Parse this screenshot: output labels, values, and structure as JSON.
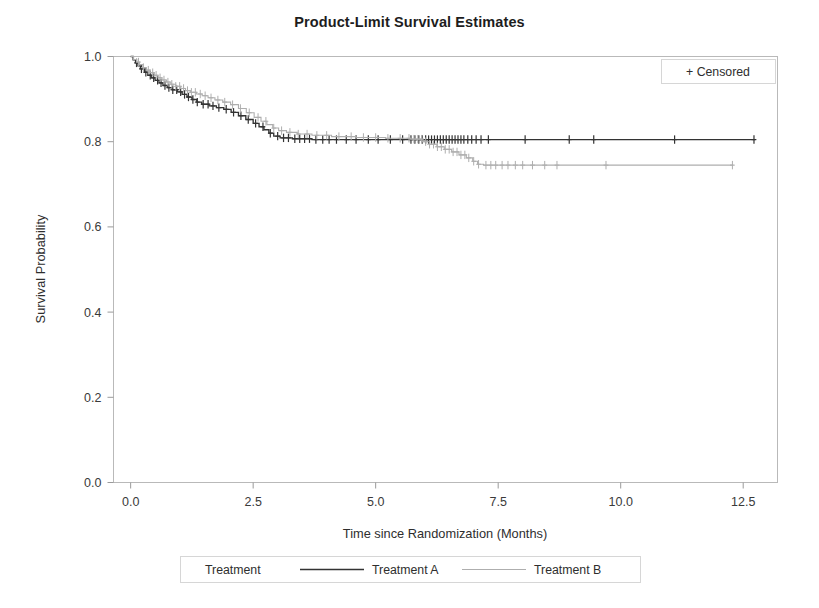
{
  "chart_data": {
    "type": "line",
    "title": "Product-Limit Survival Estimates",
    "xlabel": "Time since Randomization (Months)",
    "ylabel": "Survival Probability",
    "xlim": [
      -0.35,
      13.2
    ],
    "ylim": [
      0.0,
      1.0
    ],
    "xticks": [
      "0.0",
      "2.5",
      "5.0",
      "7.5",
      "10.0",
      "12.5"
    ],
    "xtick_values": [
      0.0,
      2.5,
      5.0,
      7.5,
      10.0,
      12.5
    ],
    "yticks": [
      "0.0",
      "0.2",
      "0.4",
      "0.6",
      "0.8",
      "1.0"
    ],
    "ytick_values": [
      0.0,
      0.2,
      0.4,
      0.6,
      0.8,
      1.0
    ],
    "grid": false,
    "legend_position": "bottom-center",
    "censored_annotation": "+ Censored",
    "censored_marker": "+",
    "legend_title": "Treatment",
    "series": [
      {
        "name": "Treatment A",
        "color": "#333333",
        "final_survival": 0.805,
        "max_time": 12.75,
        "steps": [
          [
            0.0,
            1.0
          ],
          [
            0.05,
            0.992
          ],
          [
            0.1,
            0.985
          ],
          [
            0.15,
            0.978
          ],
          [
            0.2,
            0.971
          ],
          [
            0.28,
            0.963
          ],
          [
            0.35,
            0.956
          ],
          [
            0.42,
            0.95
          ],
          [
            0.5,
            0.944
          ],
          [
            0.58,
            0.938
          ],
          [
            0.66,
            0.932
          ],
          [
            0.75,
            0.927
          ],
          [
            0.85,
            0.922
          ],
          [
            0.95,
            0.917
          ],
          [
            1.05,
            0.911
          ],
          [
            1.15,
            0.905
          ],
          [
            1.25,
            0.899
          ],
          [
            1.35,
            0.893
          ],
          [
            1.45,
            0.888
          ],
          [
            1.6,
            0.884
          ],
          [
            1.75,
            0.88
          ],
          [
            1.9,
            0.876
          ],
          [
            2.05,
            0.869
          ],
          [
            2.2,
            0.861
          ],
          [
            2.35,
            0.852
          ],
          [
            2.5,
            0.843
          ],
          [
            2.62,
            0.835
          ],
          [
            2.72,
            0.828
          ],
          [
            2.82,
            0.82
          ],
          [
            2.92,
            0.813
          ],
          [
            3.05,
            0.809
          ],
          [
            3.3,
            0.807
          ],
          [
            3.7,
            0.805
          ],
          [
            4.3,
            0.805
          ],
          [
            5.2,
            0.805
          ],
          [
            6.0,
            0.805
          ],
          [
            6.6,
            0.805
          ],
          [
            7.2,
            0.805
          ],
          [
            8.1,
            0.805
          ],
          [
            9.4,
            0.805
          ],
          [
            11.1,
            0.805
          ],
          [
            12.75,
            0.805
          ]
        ],
        "censor_times": [
          0.12,
          0.22,
          0.31,
          0.4,
          0.47,
          0.55,
          0.62,
          0.7,
          0.78,
          0.86,
          0.94,
          1.02,
          1.1,
          1.18,
          1.27,
          1.36,
          1.48,
          1.58,
          1.68,
          1.8,
          1.95,
          2.1,
          2.25,
          2.4,
          2.55,
          2.7,
          2.85,
          3.0,
          3.12,
          3.22,
          3.35,
          3.45,
          3.55,
          3.65,
          3.78,
          3.92,
          4.05,
          4.2,
          4.4,
          4.6,
          4.85,
          5.05,
          5.3,
          5.55,
          5.72,
          5.8,
          5.88,
          5.95,
          6.02,
          6.08,
          6.14,
          6.2,
          6.26,
          6.32,
          6.38,
          6.44,
          6.5,
          6.56,
          6.62,
          6.68,
          6.74,
          6.8,
          6.88,
          6.96,
          7.05,
          7.15,
          7.3,
          8.05,
          8.95,
          9.45,
          11.1,
          12.72
        ]
      },
      {
        "name": "Treatment B",
        "color": "#aeaeae",
        "final_survival": 0.745,
        "max_time": 12.3,
        "steps": [
          [
            0.0,
            1.0
          ],
          [
            0.06,
            0.993
          ],
          [
            0.12,
            0.987
          ],
          [
            0.18,
            0.981
          ],
          [
            0.25,
            0.974
          ],
          [
            0.32,
            0.968
          ],
          [
            0.4,
            0.962
          ],
          [
            0.48,
            0.956
          ],
          [
            0.56,
            0.95
          ],
          [
            0.64,
            0.945
          ],
          [
            0.73,
            0.94
          ],
          [
            0.82,
            0.935
          ],
          [
            0.92,
            0.93
          ],
          [
            1.02,
            0.925
          ],
          [
            1.12,
            0.92
          ],
          [
            1.22,
            0.916
          ],
          [
            1.34,
            0.912
          ],
          [
            1.46,
            0.908
          ],
          [
            1.58,
            0.903
          ],
          [
            1.72,
            0.898
          ],
          [
            1.88,
            0.893
          ],
          [
            2.04,
            0.887
          ],
          [
            2.2,
            0.878
          ],
          [
            2.36,
            0.868
          ],
          [
            2.52,
            0.857
          ],
          [
            2.66,
            0.848
          ],
          [
            2.78,
            0.84
          ],
          [
            2.9,
            0.832
          ],
          [
            3.02,
            0.826
          ],
          [
            3.18,
            0.822
          ],
          [
            3.4,
            0.818
          ],
          [
            3.7,
            0.815
          ],
          [
            4.1,
            0.812
          ],
          [
            4.6,
            0.81
          ],
          [
            5.2,
            0.808
          ],
          [
            5.7,
            0.806
          ],
          [
            5.95,
            0.8
          ],
          [
            6.1,
            0.794
          ],
          [
            6.25,
            0.788
          ],
          [
            6.4,
            0.782
          ],
          [
            6.55,
            0.776
          ],
          [
            6.7,
            0.769
          ],
          [
            6.85,
            0.762
          ],
          [
            6.98,
            0.754
          ],
          [
            7.08,
            0.747
          ],
          [
            7.2,
            0.745
          ],
          [
            7.8,
            0.745
          ],
          [
            8.6,
            0.745
          ],
          [
            9.8,
            0.745
          ],
          [
            11.2,
            0.745
          ],
          [
            12.3,
            0.745
          ]
        ],
        "censor_times": [
          0.16,
          0.26,
          0.36,
          0.45,
          0.52,
          0.6,
          0.68,
          0.76,
          0.84,
          0.92,
          1.0,
          1.08,
          1.16,
          1.24,
          1.32,
          1.42,
          1.52,
          1.64,
          1.78,
          1.92,
          2.08,
          2.24,
          2.42,
          2.6,
          2.76,
          2.92,
          3.08,
          3.25,
          3.42,
          3.6,
          3.8,
          4.0,
          4.25,
          4.5,
          4.75,
          5.0,
          5.25,
          5.5,
          5.68,
          5.78,
          5.86,
          5.94,
          6.02,
          6.1,
          6.18,
          6.26,
          6.34,
          6.42,
          6.5,
          6.58,
          6.66,
          6.74,
          6.82,
          6.9,
          7.0,
          7.1,
          7.25,
          7.35,
          7.45,
          7.58,
          7.7,
          7.85,
          8.0,
          8.2,
          8.45,
          8.7,
          9.7,
          12.28
        ]
      }
    ]
  },
  "legend": {
    "title": "Treatment",
    "entries": [
      {
        "label": "Treatment A",
        "color": "#333333"
      },
      {
        "label": "Treatment B",
        "color": "#aeaeae"
      }
    ]
  },
  "annotations": {
    "censored_label": "+ Censored"
  }
}
